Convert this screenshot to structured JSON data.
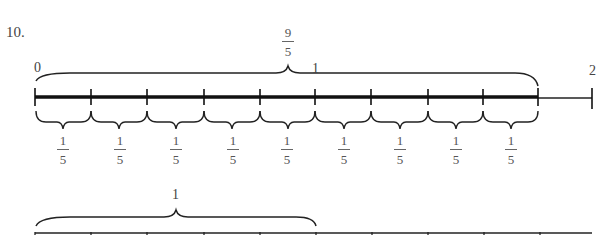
{
  "problem_number": "10.",
  "top_line": {
    "labels": {
      "zero": "0",
      "one": "1",
      "two": "2"
    },
    "top_brace_label": {
      "numerator": "9",
      "denominator": "5"
    },
    "segment_labels": [
      {
        "numerator": "1",
        "denominator": "5"
      },
      {
        "numerator": "1",
        "denominator": "5"
      },
      {
        "numerator": "1",
        "denominator": "5"
      },
      {
        "numerator": "1",
        "denominator": "5"
      },
      {
        "numerator": "1",
        "denominator": "5"
      },
      {
        "numerator": "1",
        "denominator": "5"
      },
      {
        "numerator": "1",
        "denominator": "5"
      },
      {
        "numerator": "1",
        "denominator": "5"
      },
      {
        "numerator": "1",
        "denominator": "5"
      }
    ]
  },
  "bottom_line": {
    "brace_label": "1"
  },
  "colors": {
    "ink": "#222222",
    "background": "#ffffff"
  }
}
